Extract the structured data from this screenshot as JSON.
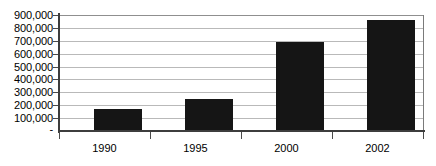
{
  "chart_data": {
    "type": "bar",
    "title": "",
    "subtitle": "",
    "xlabel": "",
    "ylabel": "",
    "categories": [
      "1990",
      "1995",
      "2000",
      "2002"
    ],
    "values": [
      170000,
      250000,
      690000,
      860000
    ],
    "series": [
      {
        "name": "",
        "values": [
          170000,
          250000,
          690000,
          860000
        ]
      }
    ],
    "ylim": [
      0,
      900000
    ],
    "ytick_values": [
      0,
      100000,
      200000,
      300000,
      400000,
      500000,
      600000,
      700000,
      800000,
      900000
    ],
    "ytick_labels": [
      "-",
      "100,000",
      "200,000",
      "300,000",
      "400,000",
      "500,000",
      "600,000",
      "700,000",
      "800,000",
      "900,000"
    ],
    "grid": true,
    "grid_axis": "y",
    "legend": false,
    "legend_position": "none",
    "bar_color": "#151515",
    "gridline_color": "#b9b9b9",
    "axis_color": "#3d3d3d",
    "background_color": "#ffffff",
    "annotations": []
  }
}
